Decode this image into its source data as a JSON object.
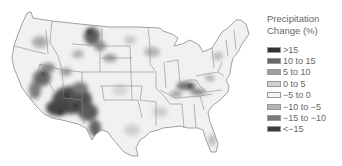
{
  "legend": {
    "title_line1": "Precipitation",
    "title_line2": "Change (%)",
    "items": [
      {
        "label": ">15",
        "color": "#333333"
      },
      {
        "label": "10 to 15",
        "color": "#676767"
      },
      {
        "label": "5 to 10",
        "color": "#a0a0a0"
      },
      {
        "label": "0 to 5",
        "color": "#d2d2d2"
      },
      {
        "label": "−5 to 0",
        "color": "#f4f4f4"
      },
      {
        "label": "−10 to −5",
        "color": "#b4b4b4"
      },
      {
        "label": "−15 to −10",
        "color": "#7a7a7a"
      },
      {
        "label": "<−15",
        "color": "#3c3c3c"
      }
    ]
  },
  "map": {
    "region": "Contiguous United States",
    "base_fill": "#f0f0f0",
    "border_color": "#8a8a8a",
    "hotspots": [
      {
        "area": "Southwest (AZ/NM)",
        "level": "dark"
      },
      {
        "area": "Nevada/California",
        "level": "dark"
      },
      {
        "area": "Montana",
        "level": "dark"
      },
      {
        "area": "Tennessee/Kentucky",
        "level": "medium"
      },
      {
        "area": "Wisconsin",
        "level": "light"
      },
      {
        "area": "Florida",
        "level": "light"
      }
    ]
  }
}
